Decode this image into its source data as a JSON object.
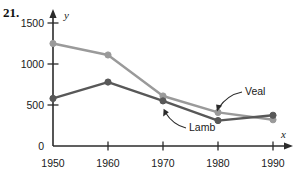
{
  "figure": {
    "problem_number": "21.",
    "axis_x_name": "x",
    "axis_y_name": "y"
  },
  "chart_data": {
    "type": "line",
    "title": "",
    "xlabel": "x",
    "ylabel": "y",
    "categories": [
      "1950",
      "1960",
      "1970",
      "1980",
      "1990"
    ],
    "x": [
      1950,
      1960,
      1970,
      1980,
      1990
    ],
    "xlim": [
      1950,
      1990
    ],
    "ylim": [
      0,
      1500
    ],
    "yticks": [
      "0",
      "500",
      "1000",
      "1500"
    ],
    "ytick_values": [
      0,
      500,
      1000,
      1500
    ],
    "xticks": [
      "1950",
      "1960",
      "1970",
      "1980",
      "1990"
    ],
    "grid": false,
    "legend": "annotations",
    "series": [
      {
        "name": "Veal",
        "color": "#9a9a9a",
        "values": [
          1250,
          1110,
          610,
          410,
          320
        ],
        "annotation": "Veal"
      },
      {
        "name": "Lamb",
        "color": "#585858",
        "values": [
          580,
          780,
          550,
          310,
          375
        ],
        "annotation": "Lamb"
      }
    ],
    "annotations": [
      {
        "text": "Veal",
        "points_to_series": "Veal",
        "points_to_x": 1980
      },
      {
        "text": "Lamb",
        "points_to_series": "Lamb",
        "points_to_x": 1970
      }
    ]
  }
}
